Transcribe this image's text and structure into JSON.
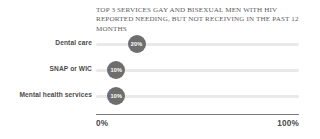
{
  "chart_data": {
    "type": "bar",
    "title": "TOP 3 SERVICES GAY AND BISEXUAL MEN WITH HIV REPORTED NEEDING, BUT NOT RECEIVING IN THE PAST 12 MONTHS",
    "xlabel": "",
    "ylabel": "",
    "xlim": [
      0,
      100
    ],
    "grid": false,
    "legend": "none",
    "categories": [
      "Dental care",
      "SNAP or WIC",
      "Mental health services"
    ],
    "values": [
      20,
      10,
      10
    ],
    "value_labels": [
      "20%",
      "10%",
      "10%"
    ],
    "axis_ticks": [
      "0%",
      "100%"
    ],
    "colors": {
      "dot": "#6e6e6e",
      "track": "#e9e9e9",
      "axis": "#7a7a7a",
      "title_text": "#5c5c5c",
      "label_text": "#4a4a4a",
      "value_text": "#ffffff",
      "background": "#ffffff"
    }
  }
}
